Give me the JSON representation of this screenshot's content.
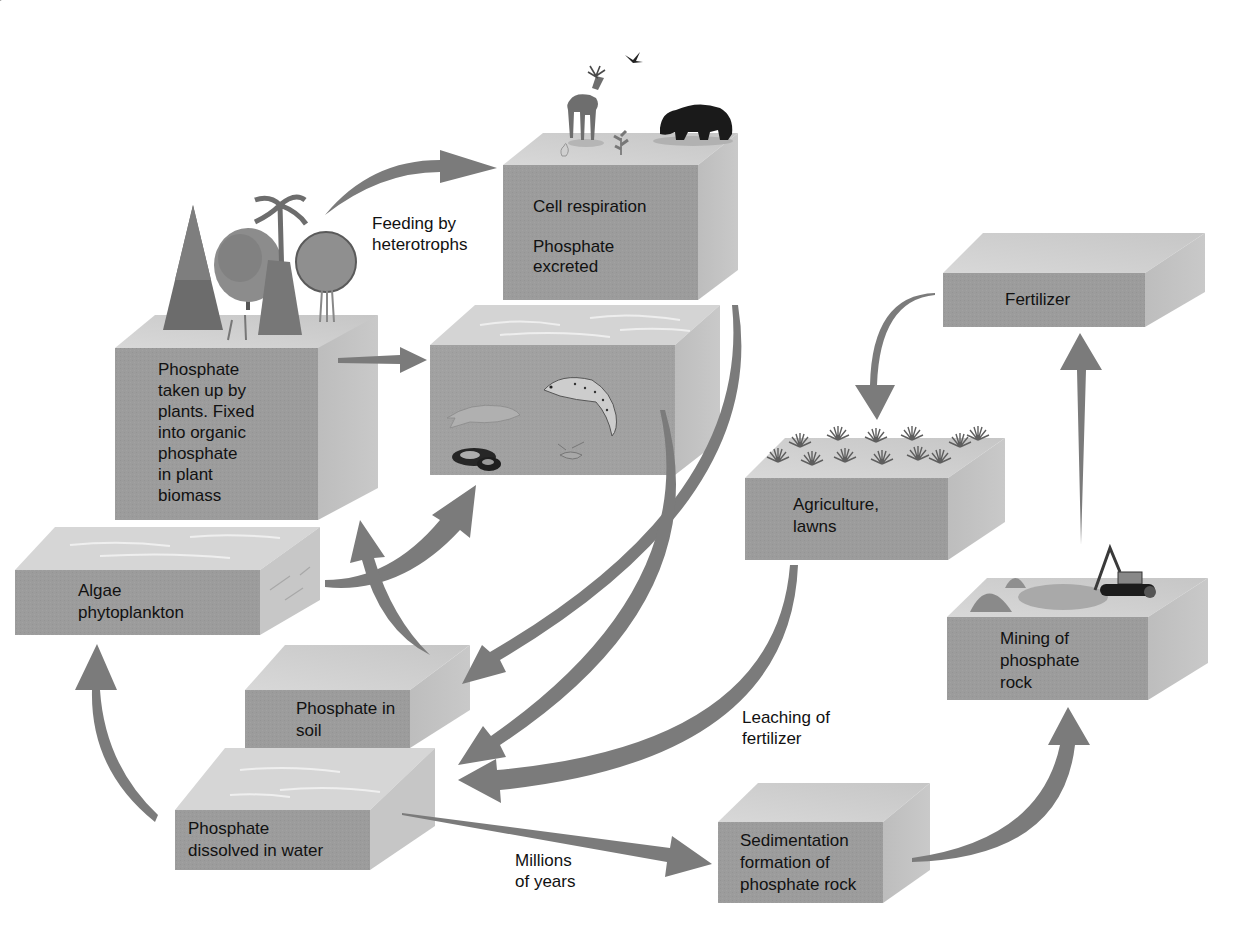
{
  "colors": {
    "background": "#ffffff",
    "block_front": "#9a9a9a",
    "block_top": "#cfcfcf",
    "block_side": "#b8b8b8",
    "water_top": "#d9d9d9",
    "arrow": "#7d7d7d",
    "text": "#111111"
  },
  "blocks": [
    {
      "id": "heterotrophs",
      "label": "Cell respiration\n\nPhosphate\nexcreted",
      "illustration": "deer-bear-bird-icon"
    },
    {
      "id": "aquatic",
      "label": "",
      "illustration": "fish-icon"
    },
    {
      "id": "plants",
      "label": "Phosphate\ntaken up by\nplants. Fixed\ninto organic\nphosphate\nin plant\nbiomass",
      "illustration": "trees-icon"
    },
    {
      "id": "algae",
      "label": "Algae\nphytoplankton",
      "illustration": "water-surface"
    },
    {
      "id": "soil",
      "label": "Phosphate in\nsoil",
      "illustration": ""
    },
    {
      "id": "dissolved",
      "label": "Phosphate\ndissolved in water",
      "illustration": "water-surface"
    },
    {
      "id": "fertilizer",
      "label": "Fertilizer",
      "illustration": ""
    },
    {
      "id": "agriculture",
      "label": "Agriculture,\nlawns",
      "illustration": "crops-icon"
    },
    {
      "id": "mining",
      "label": "Mining of\nphosphate\nrock",
      "illustration": "excavator-icon"
    },
    {
      "id": "sedimentation",
      "label": "Sedimentation\nformation of\nphosphate rock",
      "illustration": ""
    }
  ],
  "flow_labels": {
    "feeding": "Feeding by\nheterotrophs",
    "leaching": "Leaching of\nfertilizer",
    "millions": "Millions\nof years"
  },
  "arrows": [
    {
      "from": "plants",
      "to": "heterotrophs",
      "label": "Feeding by heterotrophs"
    },
    {
      "from": "plants",
      "to": "aquatic"
    },
    {
      "from": "algae",
      "to": "aquatic"
    },
    {
      "from": "soil",
      "to": "plants"
    },
    {
      "from": "heterotrophs",
      "to": "soil"
    },
    {
      "from": "aquatic",
      "to": "dissolved"
    },
    {
      "from": "agriculture",
      "to": "dissolved",
      "label": "Leaching of fertilizer"
    },
    {
      "from": "dissolved",
      "to": "algae"
    },
    {
      "from": "dissolved",
      "to": "sedimentation",
      "label": "Millions of years"
    },
    {
      "from": "sedimentation",
      "to": "mining"
    },
    {
      "from": "mining",
      "to": "fertilizer"
    },
    {
      "from": "fertilizer",
      "to": "agriculture"
    }
  ]
}
